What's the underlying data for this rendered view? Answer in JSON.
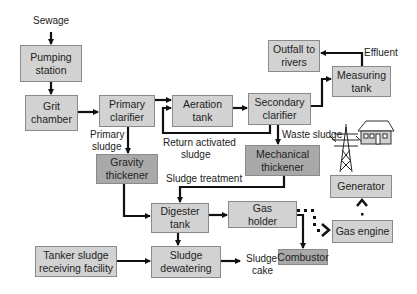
{
  "diagram": {
    "type": "flowchart",
    "colors": {
      "box_light": "#d2d2d2",
      "box_dark": "#a9a9a9",
      "arrow": "#111111",
      "text": "#222222"
    },
    "nodes": {
      "pumping_station": "Pumping station",
      "grit_chamber": "Grit chamber",
      "primary_clarifier": "Primary clarifier",
      "aeration_tank": "Aeration tank",
      "secondary_clarifier": "Secondary clarifier",
      "outfall": "Outfall to rivers",
      "measuring_tank": "Measuring tank",
      "gravity_thickener": "Gravity thickener",
      "mechanical_thickener": "Mechanical thickener",
      "digester_tank": "Digester tank",
      "gas_holder": "Gas holder",
      "generator": "Generator",
      "gas_engine": "Gas engine",
      "tanker_facility": "Tanker sludge receiving facility",
      "sludge_dewatering": "Sludge dewatering",
      "combustor": "Combustor"
    },
    "labels": {
      "sewage": "Sewage",
      "effluent": "Effluent",
      "primary_sludge_1": "Primary",
      "primary_sludge_2": "sludge",
      "return_activated_1": "Return activated",
      "return_activated_2": "sludge",
      "waste_sludge": "Waste sludge",
      "sludge_treatment": "Sludge treatment",
      "sludge_cake_1": "Sludge",
      "sludge_cake_2": "cake"
    },
    "icons": [
      "power-tower-icon",
      "house-icon"
    ]
  }
}
